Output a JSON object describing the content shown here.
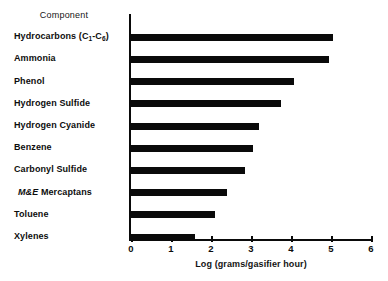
{
  "chart_data": {
    "type": "bar",
    "orientation": "horizontal",
    "title": "",
    "column_header": "Component",
    "xlabel": "Log (grams/gasifier hour)",
    "ylabel": "",
    "xlim": [
      0,
      6
    ],
    "xticks": [
      "0",
      "1",
      "2",
      "3",
      "4",
      "5",
      "6"
    ],
    "grid": false,
    "legend": false,
    "bar_color": "#0a0a0a",
    "axis_color": "#0a0a0a",
    "background": "#ffffff",
    "categories": [
      "Hydrocarbons (C1-C6)",
      "Ammonia",
      "Phenol",
      "Hydrogen Sulfide",
      "Hydrogen Cyanide",
      "Benzene",
      "Carbonyl Sulfide",
      "M&E Mercaptans",
      "Toluene",
      "Xylenes"
    ],
    "values": [
      5.05,
      4.95,
      4.07,
      3.75,
      3.2,
      3.05,
      2.85,
      2.4,
      2.1,
      1.6
    ]
  },
  "labels": {
    "header": "Component",
    "rows": [
      {
        "pre": "Hydrocarbons (C",
        "sub1": "1",
        "mid": "-C",
        "sub2": "6",
        "post": ")"
      },
      {
        "text": "Ammonia"
      },
      {
        "text": "Phenol"
      },
      {
        "text": "Hydrogen Sulfide"
      },
      {
        "text": "Hydrogen Cyanide"
      },
      {
        "text": "Benzene"
      },
      {
        "text": "Carbonyl Sulfide"
      },
      {
        "italic": "M&E",
        "text": " Mercaptans"
      },
      {
        "text": "Toluene"
      },
      {
        "text": "Xylenes"
      }
    ]
  }
}
